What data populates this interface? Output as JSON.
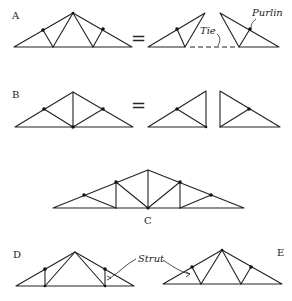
{
  "diagram": {
    "labels": {
      "a": "A",
      "b": "B",
      "c": "C",
      "d": "D",
      "e": "E"
    },
    "annotations": {
      "purlin": "Purlin",
      "tie": "Tie",
      "strut": "Strut"
    },
    "equals_symbol": "=",
    "colors": {
      "line": "#222222",
      "node": "#111111",
      "background": "#ffffff"
    },
    "trusses": [
      {
        "id": "A",
        "description": "Fink truss with two inclined web pairs",
        "decomposition": "two triangular halves joined by tie"
      },
      {
        "id": "B",
        "description": "King post truss with inclined struts",
        "decomposition": "two right-triangle halves"
      },
      {
        "id": "C",
        "description": "Multi-panel truss with king post, queen posts and diagonals"
      },
      {
        "id": "D",
        "description": "Truss with vertical struts and diagonals to apex"
      },
      {
        "id": "E",
        "description": "Fink-type truss with inclined struts"
      }
    ]
  }
}
